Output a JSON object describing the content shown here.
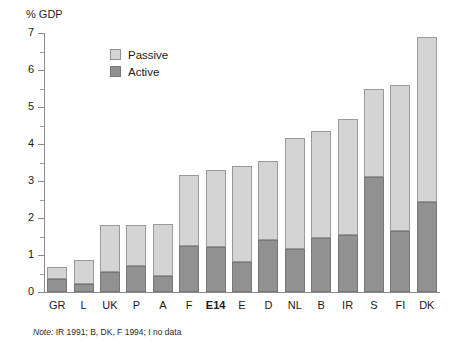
{
  "axis": {
    "y_title": "% GDP",
    "y_ticks": [
      "0",
      "1",
      "2",
      "3",
      "4",
      "5",
      "6",
      "7"
    ],
    "y_min": 0,
    "y_max": 7
  },
  "legend": {
    "items": [
      {
        "label": "Passive",
        "color": "#d4d4d4"
      },
      {
        "label": "Active",
        "color": "#919191"
      }
    ]
  },
  "note": {
    "prefix": "Note:",
    "text": " IR 1991; B, DK, F 1994; I no data"
  },
  "chart_data": {
    "type": "bar",
    "stacked": true,
    "title": "",
    "xlabel": "",
    "ylabel": "% GDP",
    "ylim": [
      0,
      7
    ],
    "grid": false,
    "legend_position": "inside-top-left",
    "categories": [
      "GR",
      "L",
      "UK",
      "P",
      "A",
      "F",
      "E14",
      "E",
      "D",
      "NL",
      "B",
      "IR",
      "S",
      "FI",
      "DK"
    ],
    "highlighted_category": "E14",
    "series": [
      {
        "name": "Active",
        "color": "#919191",
        "values": [
          0.35,
          0.22,
          0.55,
          0.7,
          0.42,
          1.25,
          1.22,
          0.82,
          1.4,
          1.15,
          1.45,
          1.55,
          3.12,
          1.65,
          2.42
        ]
      },
      {
        "name": "Passive",
        "color": "#d4d4d4",
        "values": [
          0.33,
          0.65,
          1.25,
          1.12,
          1.43,
          1.9,
          2.08,
          2.58,
          2.15,
          3.0,
          2.9,
          3.12,
          2.38,
          3.95,
          4.48
        ]
      }
    ],
    "totals": [
      0.68,
      0.87,
      1.8,
      1.82,
      1.85,
      3.15,
      3.3,
      3.4,
      3.55,
      4.15,
      4.35,
      4.67,
      5.5,
      5.6,
      6.9
    ]
  }
}
